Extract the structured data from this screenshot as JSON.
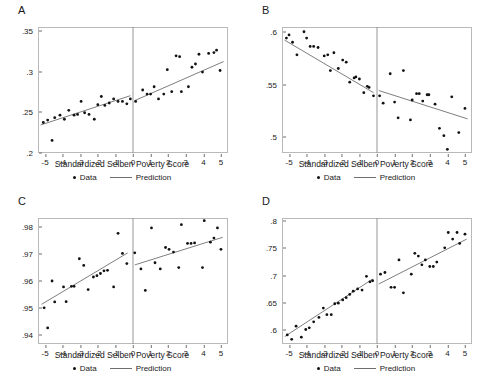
{
  "figure": {
    "xlabel": "Standardized Selben Poverty Score",
    "legend": {
      "data_label": "Data",
      "prediction_label": "Prediction"
    },
    "colors": {
      "point": "#111111",
      "line": "#6f6f6f",
      "frame": "#b9b9b9",
      "cutoff": "#8a8a8a"
    }
  },
  "chart_data": [
    {
      "type": "scatter",
      "panel": "A",
      "title": "A",
      "xlabel": "Standardized Selben Poverty Score",
      "ylabel": "",
      "xlim": [
        -5.4,
        5.4
      ],
      "ylim": [
        0.2,
        0.355
      ],
      "xticks": [
        -5,
        -4,
        -3,
        -2,
        -1,
        0,
        1,
        2,
        3,
        4,
        5
      ],
      "xticklabels": [
        "-5",
        "-4",
        "-3",
        "-2",
        "-1",
        "0",
        "1",
        "2",
        "3",
        "4",
        "5"
      ],
      "yticks": [
        0.2,
        0.25,
        0.3,
        0.35
      ],
      "yticklabels": [
        ".2",
        ".25",
        ".3",
        ".35"
      ],
      "grid": false,
      "cutoff": 0,
      "legend_position": "below",
      "points": [
        [
          -5.1,
          0.2375
        ],
        [
          -4.85,
          0.2405
        ],
        [
          -4.6,
          0.2155
        ],
        [
          -4.45,
          0.2435
        ],
        [
          -4.15,
          0.2465
        ],
        [
          -3.9,
          0.2415
        ],
        [
          -3.65,
          0.2525
        ],
        [
          -3.35,
          0.2465
        ],
        [
          -3.15,
          0.2475
        ],
        [
          -2.95,
          0.2635
        ],
        [
          -2.75,
          0.2495
        ],
        [
          -2.5,
          0.2475
        ],
        [
          -2.2,
          0.2415
        ],
        [
          -2.0,
          0.2595
        ],
        [
          -1.8,
          0.2695
        ],
        [
          -1.6,
          0.2585
        ],
        [
          -1.35,
          0.2615
        ],
        [
          -1.1,
          0.2665
        ],
        [
          -0.85,
          0.2635
        ],
        [
          -0.6,
          0.2635
        ],
        [
          -0.35,
          0.2605
        ],
        [
          -0.15,
          0.2665
        ],
        [
          0.15,
          0.2635
        ],
        [
          0.55,
          0.2775
        ],
        [
          0.8,
          0.2725
        ],
        [
          1.0,
          0.2725
        ],
        [
          1.2,
          0.2815
        ],
        [
          1.45,
          0.2665
        ],
        [
          1.75,
          0.2725
        ],
        [
          1.95,
          0.3025
        ],
        [
          2.2,
          0.2755
        ],
        [
          2.45,
          0.3195
        ],
        [
          2.65,
          0.3185
        ],
        [
          2.75,
          0.2755
        ],
        [
          3.15,
          0.2815
        ],
        [
          3.35,
          0.3055
        ],
        [
          3.55,
          0.3095
        ],
        [
          3.75,
          0.3215
        ],
        [
          3.95,
          0.2995
        ],
        [
          4.3,
          0.3225
        ],
        [
          4.6,
          0.3235
        ],
        [
          4.75,
          0.3265
        ],
        [
          4.95,
          0.3015
        ]
      ],
      "prediction_left": {
        "x": [
          -5.25,
          -0.15
        ],
        "y": [
          0.2345,
          0.2705
        ]
      },
      "prediction_right": {
        "x": [
          0.1,
          5.15
        ],
        "y": [
          0.2645,
          0.3125
        ]
      }
    },
    {
      "type": "scatter",
      "panel": "B",
      "title": "B",
      "xlabel": "Standardized Selben Poverty Score",
      "ylabel": "",
      "xlim": [
        -5.4,
        5.4
      ],
      "ylim": [
        0.485,
        0.605
      ],
      "xticks": [
        -5,
        -4,
        -3,
        -2,
        -1,
        0,
        1,
        2,
        3,
        4,
        5
      ],
      "xticklabels": [
        "-5",
        "-4",
        "-3",
        "-2",
        "-1",
        "0",
        "1",
        "2",
        "3",
        "4",
        "5"
      ],
      "yticks": [
        0.5,
        0.55,
        0.6
      ],
      "yticklabels": [
        ".5",
        ".55",
        ".6"
      ],
      "grid": false,
      "cutoff": 0,
      "legend_position": "below",
      "points": [
        [
          -5.15,
          0.5945
        ],
        [
          -5.0,
          0.5975
        ],
        [
          -4.8,
          0.5905
        ],
        [
          -4.55,
          0.5785
        ],
        [
          -4.15,
          0.6005
        ],
        [
          -4.0,
          0.5945
        ],
        [
          -3.8,
          0.5865
        ],
        [
          -3.6,
          0.5865
        ],
        [
          -3.35,
          0.5855
        ],
        [
          -3.0,
          0.5775
        ],
        [
          -2.8,
          0.5785
        ],
        [
          -2.65,
          0.5635
        ],
        [
          -2.45,
          0.5805
        ],
        [
          -2.2,
          0.5655
        ],
        [
          -1.95,
          0.5735
        ],
        [
          -1.75,
          0.5715
        ],
        [
          -1.55,
          0.5525
        ],
        [
          -1.3,
          0.5565
        ],
        [
          -1.2,
          0.5575
        ],
        [
          -1.0,
          0.5555
        ],
        [
          -0.75,
          0.5425
        ],
        [
          -0.55,
          0.5485
        ],
        [
          -0.45,
          0.5475
        ],
        [
          -0.2,
          0.5395
        ],
        [
          0.15,
          0.5395
        ],
        [
          0.35,
          0.5325
        ],
        [
          0.75,
          0.5605
        ],
        [
          1.0,
          0.5335
        ],
        [
          1.2,
          0.5185
        ],
        [
          1.5,
          0.5635
        ],
        [
          1.9,
          0.5165
        ],
        [
          2.0,
          0.5355
        ],
        [
          2.25,
          0.5415
        ],
        [
          2.4,
          0.5415
        ],
        [
          2.6,
          0.5345
        ],
        [
          2.85,
          0.5405
        ],
        [
          2.95,
          0.5405
        ],
        [
          3.3,
          0.5315
        ],
        [
          3.55,
          0.5085
        ],
        [
          3.8,
          0.5015
        ],
        [
          4.0,
          0.4885
        ],
        [
          4.25,
          0.5385
        ],
        [
          4.65,
          0.5045
        ],
        [
          5.0,
          0.5275
        ]
      ],
      "prediction_left": {
        "x": [
          -5.25,
          -0.2
        ],
        "y": [
          0.5925,
          0.5425
        ]
      },
      "prediction_right": {
        "x": [
          0.1,
          5.15
        ],
        "y": [
          0.5445,
          0.5175
        ]
      }
    },
    {
      "type": "scatter",
      "panel": "C",
      "title": "C",
      "xlabel": "Standardized Selben Poverty Score",
      "ylabel": "",
      "xlim": [
        -5.4,
        5.4
      ],
      "ylim": [
        0.9365,
        0.9835
      ],
      "xticks": [
        -5,
        -4,
        -3,
        -2,
        -1,
        0,
        1,
        2,
        3,
        4,
        5
      ],
      "xticklabels": [
        "-5",
        "-4",
        "-3",
        "-2",
        "-1",
        "0",
        "1",
        "2",
        "3",
        "4",
        "5"
      ],
      "yticks": [
        0.94,
        0.95,
        0.96,
        0.97,
        0.98
      ],
      "yticklabels": [
        ".94",
        ".95",
        ".96",
        ".97",
        ".98"
      ],
      "grid": false,
      "cutoff": 0,
      "legend_position": "below",
      "points": [
        [
          -5.05,
          0.95
        ],
        [
          -4.85,
          0.9425
        ],
        [
          -4.6,
          0.96
        ],
        [
          -4.45,
          0.9522
        ],
        [
          -3.95,
          0.9578
        ],
        [
          -3.8,
          0.9523
        ],
        [
          -3.5,
          0.958
        ],
        [
          -3.35,
          0.958
        ],
        [
          -3.05,
          0.9683
        ],
        [
          -2.8,
          0.9658
        ],
        [
          -2.55,
          0.9568
        ],
        [
          -2.25,
          0.9615
        ],
        [
          -2.05,
          0.962
        ],
        [
          -1.85,
          0.9628
        ],
        [
          -1.65,
          0.9638
        ],
        [
          -1.45,
          0.964
        ],
        [
          -1.1,
          0.9578
        ],
        [
          -0.85,
          0.9778
        ],
        [
          -0.6,
          0.9703
        ],
        [
          -0.35,
          0.9665
        ],
        [
          0.1,
          0.9705
        ],
        [
          0.45,
          0.9645
        ],
        [
          0.7,
          0.9565
        ],
        [
          1.05,
          0.9798
        ],
        [
          1.25,
          0.9668
        ],
        [
          1.55,
          0.9645
        ],
        [
          1.85,
          0.9725
        ],
        [
          2.05,
          0.9718
        ],
        [
          2.3,
          0.9708
        ],
        [
          2.6,
          0.965
        ],
        [
          2.75,
          0.981
        ],
        [
          3.1,
          0.974
        ],
        [
          3.3,
          0.974
        ],
        [
          3.5,
          0.9742
        ],
        [
          3.95,
          0.965
        ],
        [
          4.05,
          0.9825
        ],
        [
          4.4,
          0.9745
        ],
        [
          4.6,
          0.976
        ],
        [
          4.8,
          0.9798
        ],
        [
          5.0,
          0.9718
        ]
      ],
      "prediction_left": {
        "x": [
          -5.2,
          -0.3
        ],
        "y": [
          0.9513,
          0.9705
        ]
      },
      "prediction_right": {
        "x": [
          0.1,
          5.1
        ],
        "y": [
          0.966,
          0.9763
        ]
      }
    },
    {
      "type": "scatter",
      "panel": "D",
      "title": "D",
      "xlabel": "Standardized Selben Poverty Score",
      "ylabel": "",
      "xlim": [
        -5.4,
        5.4
      ],
      "ylim": [
        0.575,
        0.805
      ],
      "xticks": [
        -5,
        -4,
        -3,
        -2,
        -1,
        0,
        1,
        2,
        3,
        4,
        5
      ],
      "xticklabels": [
        "-5",
        "-4",
        "-3",
        "-2",
        "-1",
        "0",
        "1",
        "2",
        "3",
        "4",
        "5"
      ],
      "yticks": [
        0.6,
        0.65,
        0.7,
        0.75,
        0.8
      ],
      "yticklabels": [
        ".6",
        ".65",
        ".7",
        ".75",
        ".8"
      ],
      "grid": false,
      "cutoff": 0,
      "legend_position": "below",
      "points": [
        [
          -5.1,
          0.5915
        ],
        [
          -4.85,
          0.5835
        ],
        [
          -4.6,
          0.6075
        ],
        [
          -4.3,
          0.5875
        ],
        [
          -4.05,
          0.6015
        ],
        [
          -3.85,
          0.6045
        ],
        [
          -3.6,
          0.6155
        ],
        [
          -3.3,
          0.6235
        ],
        [
          -3.05,
          0.6405
        ],
        [
          -2.85,
          0.6285
        ],
        [
          -2.6,
          0.6285
        ],
        [
          -2.4,
          0.6485
        ],
        [
          -2.2,
          0.6495
        ],
        [
          -1.95,
          0.6555
        ],
        [
          -1.75,
          0.6595
        ],
        [
          -1.55,
          0.6655
        ],
        [
          -1.35,
          0.6715
        ],
        [
          -1.1,
          0.6755
        ],
        [
          -0.85,
          0.6735
        ],
        [
          -0.6,
          0.6985
        ],
        [
          -0.4,
          0.6885
        ],
        [
          -0.25,
          0.6905
        ],
        [
          0.2,
          0.7025
        ],
        [
          0.45,
          0.7055
        ],
        [
          0.8,
          0.6785
        ],
        [
          1.0,
          0.6785
        ],
        [
          1.25,
          0.7285
        ],
        [
          1.5,
          0.6685
        ],
        [
          1.95,
          0.7025
        ],
        [
          2.15,
          0.7405
        ],
        [
          2.35,
          0.7355
        ],
        [
          2.55,
          0.7195
        ],
        [
          2.75,
          0.7285
        ],
        [
          3.0,
          0.7165
        ],
        [
          3.2,
          0.7165
        ],
        [
          3.4,
          0.7245
        ],
        [
          3.85,
          0.7505
        ],
        [
          4.05,
          0.7785
        ],
        [
          4.3,
          0.7665
        ],
        [
          4.55,
          0.7785
        ],
        [
          4.7,
          0.7585
        ],
        [
          5.0,
          0.7755
        ]
      ],
      "prediction_left": {
        "x": [
          -5.25,
          -0.25
        ],
        "y": [
          0.5885,
          0.6935
        ]
      },
      "prediction_right": {
        "x": [
          0.1,
          5.1
        ],
        "y": [
          0.6845,
          0.7665
        ]
      }
    }
  ]
}
